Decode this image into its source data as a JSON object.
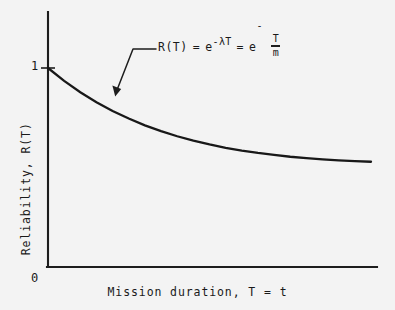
{
  "figure": {
    "background_color": "#f3f3f3",
    "ink_color": "#1d1d1d"
  },
  "axes": {
    "y_title": "Reliability, R(T)",
    "x_title": "Mission duration, T = t",
    "y_tick_label": "1",
    "origin_label": "0"
  },
  "annotation": {
    "lhs": "R(T)",
    "equals_1": "=",
    "base_1": "e",
    "exponent_1": "-λT",
    "equals_2": "=",
    "base_2": "e",
    "exponent_2_minus": "-",
    "exponent_2_numerator": "T",
    "exponent_2_denominator": "m",
    "full_text": "R(T) = e^(-λT) = e^(-T/m)"
  },
  "chart_data": {
    "type": "line",
    "title": "",
    "xlabel": "Mission duration, T = t",
    "ylabel": "Reliability, R(T)",
    "xlim": [
      0,
      10
    ],
    "ylim": [
      0,
      1.18
    ],
    "grid": false,
    "legend": null,
    "xtick_labels": [
      "0"
    ],
    "ytick_labels": [
      "1"
    ],
    "annotations": [
      "R(T) = e^(-λT) = e^(-T/m)"
    ],
    "series": [
      {
        "name": "R(T) = e^(-T/m)",
        "function": "exponential-decay",
        "x": [
          0.0,
          0.5,
          1.0,
          1.5,
          2.0,
          2.5,
          3.0,
          3.5,
          4.0,
          4.5,
          5.0,
          5.5,
          6.0,
          6.5,
          7.0,
          7.5,
          8.0,
          8.5,
          9.0,
          9.5,
          10.0
        ],
        "y": [
          1.0,
          0.935,
          0.878,
          0.828,
          0.784,
          0.746,
          0.712,
          0.683,
          0.657,
          0.635,
          0.616,
          0.599,
          0.585,
          0.573,
          0.563,
          0.554,
          0.547,
          0.541,
          0.536,
          0.532,
          0.529
        ]
      }
    ]
  }
}
